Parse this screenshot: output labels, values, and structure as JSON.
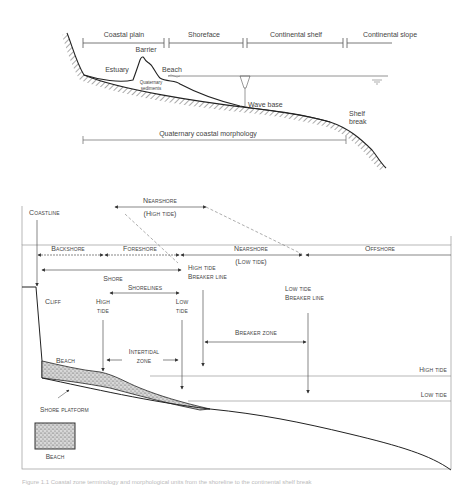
{
  "top_diagram": {
    "zones": [
      {
        "label": "Coastal plain"
      },
      {
        "label": "Shoreface"
      },
      {
        "label": "Continental shelf"
      },
      {
        "label": "Continental slope"
      }
    ],
    "features": {
      "barrier": "Barrier",
      "estuary": "Estuary",
      "beach": "Beach",
      "quaternary_sediments_line1": "Quaternary",
      "quaternary_sediments_line2": "sediments",
      "wave_base": "Wave base",
      "shelf_break_line1": "Shelf",
      "shelf_break_line2": "break"
    },
    "extent_label": "Quaternary coastal morphology"
  },
  "bottom_diagram": {
    "zones": {
      "nearshore_high": "Nearshore",
      "nearshore_high_sub": "(High tide)",
      "coastline": "Coastline",
      "backshore": "Backshore",
      "foreshore": "Foreshore",
      "nearshore_low": "Nearshore",
      "nearshore_low_sub": "(Low tide)",
      "offshore": "Offshore",
      "shore": "Shore",
      "shorelines": "Shorelines"
    },
    "features": {
      "cliff": "Cliff",
      "high_tide_shoreline_1": "High",
      "high_tide_shoreline_2": "tide",
      "low_tide_shoreline_1": "Low",
      "low_tide_shoreline_2": "tide",
      "high_tide_breaker_1": "High tide",
      "high_tide_breaker_2": "Breaker line",
      "low_tide_breaker_1": "Low tide",
      "low_tide_breaker_2": "Breaker line",
      "breaker_zone": "Breaker zone",
      "intertidal_1": "Intertidal",
      "intertidal_2": "zone",
      "beach": "Beach",
      "shore_platform": "Shore platform",
      "high_tide_level": "High tide",
      "low_tide_level": "Low tide"
    },
    "legend": {
      "beach": "Beach"
    }
  },
  "caption": "Figure 1.1  Coastal zone terminology and morphological units from the shoreline to the continental shelf break"
}
